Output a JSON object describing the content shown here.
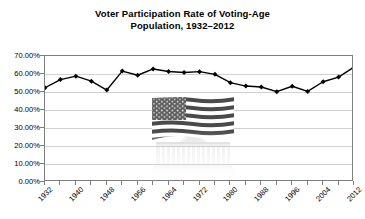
{
  "chart_data": {
    "type": "line",
    "title": "Voter Participation Rate of Voting-Age Population, 1932–2012",
    "title_lines": [
      "Voter Participation Rate of Voting-Age",
      "Population, 1932–2012"
    ],
    "xlabel": "",
    "ylabel": "",
    "ylim": [
      0,
      70
    ],
    "ytick_labels": [
      "70.00%",
      "60.00%",
      "50.00%",
      "40.00%",
      "30.00%",
      "20.00%",
      "10.00%",
      "0.00%"
    ],
    "ytick_values": [
      70,
      60,
      50,
      40,
      30,
      20,
      10,
      0
    ],
    "xlim": [
      1932,
      2012
    ],
    "xtick_labels": [
      "1932",
      "1940",
      "1948",
      "1956",
      "1964",
      "1972",
      "1980",
      "1988",
      "1996",
      "2004",
      "2012"
    ],
    "xtick_label_rotation": -45,
    "grid": "horizontal",
    "legend": "none",
    "marker": "diamond",
    "line_color": "#000000",
    "marker_color": "#000000",
    "grid_color": "#d0d0d0",
    "axis_color": "#7f7f7f",
    "background_color": "#ffffff",
    "x": [
      1932,
      1936,
      1940,
      1944,
      1948,
      1952,
      1956,
      1960,
      1964,
      1968,
      1972,
      1976,
      1980,
      1984,
      1988,
      1992,
      1996,
      2000,
      2004,
      2008,
      2012
    ],
    "values": [
      52.4,
      56.9,
      58.8,
      56.0,
      51.1,
      61.6,
      59.3,
      62.8,
      61.9,
      60.9,
      55.2,
      53.5,
      52.6,
      53.1,
      50.1,
      55.1,
      49.0,
      51.2,
      56.7,
      58.2,
      63.6
    ],
    "series": [
      {
        "name": "Voter Participation Rate",
        "points": [
          {
            "year": 1932,
            "value": 52.4
          },
          {
            "year": 1936,
            "value": 56.9
          },
          {
            "year": 1940,
            "value": 58.8
          },
          {
            "year": 1944,
            "value": 56.0
          },
          {
            "year": 1948,
            "value": 51.1
          },
          {
            "year": 1952,
            "value": 61.6
          },
          {
            "year": 1956,
            "value": 59.3
          },
          {
            "year": 1960,
            "value": 62.8
          },
          {
            "year": 1964,
            "value": 61.4
          },
          {
            "year": 1968,
            "value": 60.8
          },
          {
            "year": 1972,
            "value": 61.3
          },
          {
            "year": 1976,
            "value": 59.8
          },
          {
            "year": 1980,
            "value": 55.2
          },
          {
            "year": 1984,
            "value": 53.3
          },
          {
            "year": 1988,
            "value": 52.8
          },
          {
            "year": 1992,
            "value": 50.2
          },
          {
            "year": 1996,
            "value": 53.2
          },
          {
            "year": 2000,
            "value": 50.3
          },
          {
            "year": 2004,
            "value": 55.7
          },
          {
            "year": 2008,
            "value": 58.3
          },
          {
            "year": 2012,
            "value": 63.8
          }
        ]
      }
    ],
    "watermark": {
      "name": "us-flag-and-capitol-building-image",
      "description": "Faded photograph of the United States flag above the U.S. Capitol building, fading out toward the bottom"
    }
  }
}
